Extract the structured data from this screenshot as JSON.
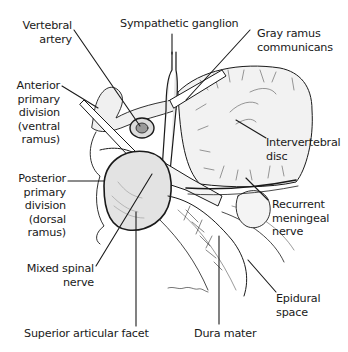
{
  "figure": {
    "colors": {
      "ink": "#1a1a1a",
      "bone_fill": "#e9e9e9",
      "shade": "#bdbdbd",
      "background": "#ffffff"
    }
  },
  "labels": {
    "vertebral_artery": "Vertebral\nartery",
    "sympathetic_ganglion": "Sympathetic ganglion",
    "gray_ramus": "Gray ramus\ncommunicans",
    "anterior_primary_division": "Anterior\nprimary\ndivision\n(ventral\nramus)",
    "intervertebral_disc": "Intervertebral\ndisc",
    "posterior_primary_division": "Posterior\nprimary\ndivision\n(dorsal\nramus)",
    "recurrent_meningeal_nerve": "Recurrent\nmeningeal\nnerve",
    "mixed_spinal_nerve": "Mixed spinal\nnerve",
    "epidural_space": "Epidural\nspace",
    "superior_articular_facet": "Superior articular facet",
    "dura_mater": "Dura mater"
  }
}
